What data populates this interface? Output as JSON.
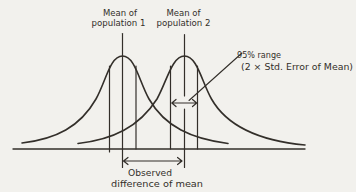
{
  "colors": {
    "ink": "#332f2a",
    "paper": "#f2f1ed"
  },
  "annotations": {
    "mean1": {
      "line1": "Mean of",
      "line2": "population 1"
    },
    "mean2": {
      "line1": "Mean of",
      "line2": "population 2"
    },
    "range": {
      "line1": "95% range",
      "line2": "(2 × Std. Error of Mean)"
    },
    "observed": {
      "line1": "Observed",
      "line2": "difference of mean"
    }
  }
}
